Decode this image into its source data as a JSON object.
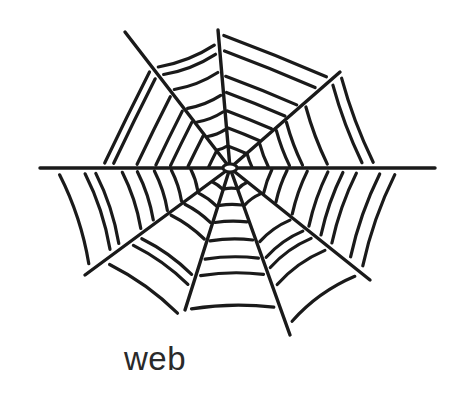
{
  "illustration": {
    "subject": "spider web",
    "stroke_color": "#1a1a1a",
    "background": "#ffffff",
    "hub": [
      230,
      168
    ],
    "radials": [
      [
        40,
        168
      ],
      [
        435,
        168
      ],
      [
        125,
        32
      ],
      [
        218,
        30
      ],
      [
        340,
        72
      ],
      [
        85,
        275
      ],
      [
        185,
        310
      ],
      [
        290,
        335
      ],
      [
        370,
        280
      ]
    ],
    "rings": [
      22,
      40,
      58,
      76,
      94,
      112,
      130,
      150,
      172,
      195
    ]
  },
  "caption": {
    "label": "web"
  }
}
